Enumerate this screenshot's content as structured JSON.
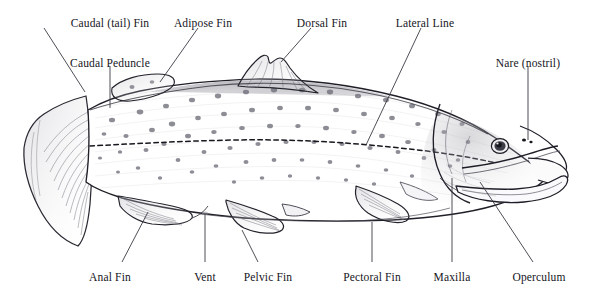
{
  "figure": {
    "style": "pencil line drawing",
    "background_color": "#ffffff",
    "ink_color": "#15151c",
    "line_color": "#3a3a44",
    "width": 591,
    "height": 292
  },
  "labels": [
    {
      "id": "caudal-tail-fin",
      "text": "Caudal (tail) Fin",
      "x": 110,
      "y": 18,
      "align": "center"
    },
    {
      "id": "caudal-peduncle",
      "text": "Caudal Peduncle",
      "x": 110,
      "y": 58,
      "align": "center"
    },
    {
      "id": "adipose-fin",
      "text": "Adipose Fin",
      "x": 203,
      "y": 18,
      "align": "center"
    },
    {
      "id": "dorsal-fin",
      "text": "Dorsal Fin",
      "x": 322,
      "y": 18,
      "align": "center"
    },
    {
      "id": "lateral-line",
      "text": "Lateral Line",
      "x": 425,
      "y": 18,
      "align": "center"
    },
    {
      "id": "nare-nostril",
      "text": "Nare (nostril)",
      "x": 528,
      "y": 58,
      "align": "center"
    },
    {
      "id": "anal-fin",
      "text": "Anal Fin",
      "x": 110,
      "y": 272,
      "align": "center"
    },
    {
      "id": "vent",
      "text": "Vent",
      "x": 205,
      "y": 272,
      "align": "center"
    },
    {
      "id": "pelvic-fin",
      "text": "Pelvic Fin",
      "x": 268,
      "y": 272,
      "align": "center"
    },
    {
      "id": "pectoral-fin",
      "text": "Pectoral Fin",
      "x": 372,
      "y": 272,
      "align": "center"
    },
    {
      "id": "maxilla",
      "text": "Maxilla",
      "x": 452,
      "y": 272,
      "align": "center"
    },
    {
      "id": "operculum",
      "text": "Operculum",
      "x": 539,
      "y": 272,
      "align": "center"
    }
  ],
  "leaders": [
    {
      "id": "leader-caudal-tail-fin",
      "from": [
        44,
        28
      ],
      "to": [
        85,
        92
      ]
    },
    {
      "id": "leader-caudal-peduncle",
      "from": [
        110,
        66
      ],
      "to": [
        110,
        108
      ]
    },
    {
      "id": "leader-adipose-fin",
      "from": [
        198,
        28
      ],
      "to": [
        160,
        82
      ]
    },
    {
      "id": "leader-dorsal-fin",
      "from": [
        311,
        28
      ],
      "to": [
        281,
        62
      ]
    },
    {
      "id": "leader-lateral-line",
      "from": [
        421,
        28
      ],
      "to": [
        366,
        145
      ]
    },
    {
      "id": "leader-nare-nostril",
      "from": [
        528,
        66
      ],
      "to": [
        528,
        140
      ]
    },
    {
      "id": "leader-anal-fin",
      "from": [
        122,
        262
      ],
      "to": [
        148,
        212
      ]
    },
    {
      "id": "leader-vent",
      "from": [
        205,
        262
      ],
      "to": [
        205,
        214
      ]
    },
    {
      "id": "leader-pelvic-fin",
      "from": [
        258,
        262
      ],
      "to": [
        242,
        230
      ]
    },
    {
      "id": "leader-pectoral-fin",
      "from": [
        372,
        262
      ],
      "to": [
        372,
        222
      ]
    },
    {
      "id": "leader-maxilla",
      "from": [
        452,
        262
      ],
      "to": [
        452,
        178
      ]
    },
    {
      "id": "leader-operculum",
      "from": [
        533,
        262
      ],
      "to": [
        480,
        182
      ]
    }
  ],
  "anatomy_parts": [
    "Caudal (tail) Fin",
    "Caudal Peduncle",
    "Adipose Fin",
    "Dorsal Fin",
    "Lateral Line",
    "Nare (nostril)",
    "Anal Fin",
    "Vent",
    "Pelvic Fin",
    "Pectoral Fin",
    "Maxilla",
    "Operculum"
  ]
}
